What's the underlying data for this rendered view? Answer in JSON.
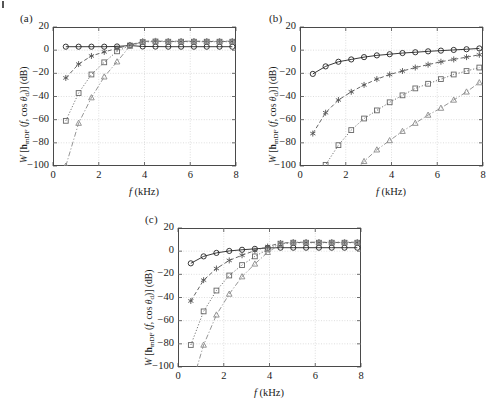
{
  "figure": {
    "width": 498,
    "height": 406,
    "background": "#ffffff",
    "line_color": "#3a3a3a",
    "grid_color": "#c8c8c8",
    "frame_color": "#4a4a4a"
  },
  "panels": [
    {
      "id": "a",
      "label": "(a)"
    },
    {
      "id": "b",
      "label": "(b)"
    },
    {
      "id": "c",
      "label": "(c)"
    }
  ],
  "axis": {
    "xlabel_plain": "f (kHz)",
    "ylabel_plain": "W [h_mDF (f, cos theta_d)] (dB)",
    "xticks": [
      "0",
      "2",
      "4",
      "6",
      "8"
    ],
    "yticks": [
      "20",
      "0",
      "-20",
      "-40",
      "-60",
      "-80",
      "-100"
    ],
    "xlim": [
      0,
      8
    ],
    "ylim": [
      -100,
      20
    ]
  },
  "chart_data": [
    {
      "type": "line",
      "panel": "(a)",
      "title": "",
      "xlabel": "f (kHz)",
      "ylabel": "W [h_mDF (f, cos theta_d)] (dB)",
      "xlim": [
        0,
        8
      ],
      "ylim": [
        -100,
        20
      ],
      "xticks": [
        0,
        2,
        4,
        6,
        8
      ],
      "yticks": [
        20,
        0,
        -20,
        -40,
        -60,
        -80,
        -100
      ],
      "grid": true,
      "legend": "none",
      "x": [
        0.56,
        1.12,
        1.68,
        2.24,
        2.8,
        3.36,
        3.92,
        4.48,
        5.04,
        5.6,
        6.16,
        6.72,
        7.28,
        7.84
      ],
      "series": [
        {
          "name": "N = 2",
          "marker": "circle",
          "linestyle": "solid",
          "values": [
            3,
            3,
            3,
            3,
            3.2,
            4,
            3.2,
            3.1,
            3,
            3,
            3,
            3,
            3,
            3
          ]
        },
        {
          "name": "N = 3",
          "marker": "asterisk",
          "linestyle": "dashed",
          "values": [
            -24,
            -12,
            -5,
            -1.5,
            1.5,
            4.5,
            7.5,
            7.8,
            7.5,
            7.5,
            7.5,
            7.5,
            7.5,
            7.5
          ]
        },
        {
          "name": "N = 4",
          "marker": "square",
          "linestyle": "dotted",
          "values": [
            -61,
            -37,
            -21,
            -10.5,
            -1,
            4,
            7,
            7.5,
            7.3,
            7.3,
            7.3,
            7.3,
            7.3,
            7.3
          ]
        },
        {
          "name": "N = 5",
          "marker": "triangle",
          "linestyle": "dashdot",
          "values": [
            -100,
            -63,
            -41,
            -23,
            -10,
            3.5,
            7.5,
            8,
            7.8,
            7.8,
            7.8,
            7.8,
            7.8,
            7.8
          ]
        }
      ]
    },
    {
      "type": "line",
      "panel": "(b)",
      "title": "",
      "xlabel": "f (kHz)",
      "ylabel": "W [h_mDF (f, cos theta_d)] (dB)",
      "xlim": [
        0,
        8
      ],
      "ylim": [
        -100,
        20
      ],
      "xticks": [
        0,
        2,
        4,
        6,
        8
      ],
      "yticks": [
        20,
        0,
        -20,
        -40,
        -60,
        -80,
        -100
      ],
      "grid": true,
      "legend": "none",
      "x": [
        0.56,
        1.12,
        1.68,
        2.24,
        2.8,
        3.36,
        3.92,
        4.48,
        5.04,
        5.6,
        6.16,
        6.72,
        7.28,
        7.84
      ],
      "series": [
        {
          "name": "N = 2",
          "marker": "circle",
          "linestyle": "solid",
          "values": [
            -20.5,
            -14,
            -10,
            -8,
            -6,
            -4.5,
            -3.5,
            -2.5,
            -1.8,
            -1,
            -0.4,
            0.2,
            0.8,
            1.5
          ]
        },
        {
          "name": "N = 3",
          "marker": "asterisk",
          "linestyle": "dashed",
          "values": [
            -72,
            -54,
            -43,
            -36,
            -30,
            -25,
            -21,
            -18,
            -15,
            -12.5,
            -10,
            -8,
            -6,
            -4
          ]
        },
        {
          "name": "N = 4",
          "marker": "square",
          "linestyle": "dotted",
          "values": [
            -130,
            -99,
            -82,
            -69,
            -59,
            -52,
            -45,
            -39,
            -33,
            -29,
            -25,
            -21,
            -18,
            -15
          ]
        },
        {
          "name": "N = 5",
          "marker": "triangle",
          "linestyle": "dashdot",
          "values": [
            -175,
            -142,
            -122,
            -108,
            -96,
            -86,
            -78,
            -70,
            -63,
            -56,
            -50,
            -43,
            -36,
            -28
          ]
        }
      ]
    },
    {
      "type": "line",
      "panel": "(c)",
      "title": "",
      "xlabel": "f (kHz)",
      "ylabel": "W [h_mDF (f, cos theta_d)] (dB)",
      "xlim": [
        0,
        8
      ],
      "ylim": [
        -100,
        20
      ],
      "xticks": [
        0,
        2,
        4,
        6,
        8
      ],
      "yticks": [
        20,
        0,
        -20,
        -40,
        -60,
        -80,
        -100
      ],
      "grid": true,
      "legend": "none",
      "x": [
        0.56,
        1.12,
        1.68,
        2.24,
        2.8,
        3.36,
        3.92,
        4.48,
        5.04,
        5.6,
        6.16,
        6.72,
        7.28,
        7.84
      ],
      "series": [
        {
          "name": "N = 2",
          "marker": "circle",
          "linestyle": "solid",
          "values": [
            -10.5,
            -4.5,
            -1.5,
            0.2,
            1.2,
            2,
            2.8,
            3,
            3,
            3,
            3,
            3,
            3,
            3
          ]
        },
        {
          "name": "N = 3",
          "marker": "asterisk",
          "linestyle": "dashed",
          "values": [
            -43,
            -25,
            -15,
            -8,
            -3.5,
            0.5,
            4,
            7,
            7.5,
            7.5,
            7.5,
            7.5,
            7.5,
            7.5
          ]
        },
        {
          "name": "N = 4",
          "marker": "square",
          "linestyle": "dotted",
          "values": [
            -81,
            -52,
            -34,
            -21,
            -12,
            -4.5,
            1.5,
            6.5,
            7.3,
            7.3,
            7.3,
            7.3,
            7.3,
            7.3
          ]
        },
        {
          "name": "N = 5",
          "marker": "triangle",
          "linestyle": "dashdot",
          "values": [
            -118,
            -81,
            -55,
            -37,
            -22,
            -11,
            -1,
            6,
            7.8,
            7.8,
            7.8,
            7.8,
            7.8,
            7.8
          ]
        }
      ]
    }
  ]
}
